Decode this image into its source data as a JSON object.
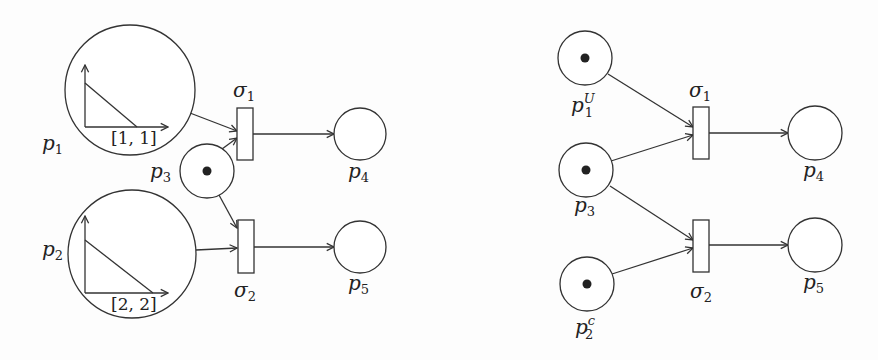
{
  "colors": {
    "stroke": "#333333",
    "token": "#222222",
    "background": "#fdfdfd"
  },
  "left_net": {
    "places": [
      {
        "id": "p1",
        "label": "p",
        "sub": "1",
        "sup": "",
        "cx": 130,
        "cy": 90,
        "r": 65,
        "token": false,
        "lx": 42,
        "ly": 150,
        "inner_plot": {
          "origin": [
            85,
            127
          ],
          "y_top": 65,
          "x_end": 168,
          "line": [
            [
              85,
              83
            ],
            [
              137,
              127
            ]
          ],
          "interval": "[1, 1]",
          "ix": 111,
          "iy": 144
        }
      },
      {
        "id": "p2",
        "label": "p",
        "sub": "2",
        "sup": "",
        "cx": 132,
        "cy": 254,
        "r": 64,
        "token": false,
        "lx": 42,
        "ly": 256,
        "inner_plot": {
          "origin": [
            85,
            293
          ],
          "y_top": 216,
          "x_end": 168,
          "line": [
            [
              85,
              240
            ],
            [
              153,
              293
            ]
          ],
          "interval": "[2, 2]",
          "ix": 111,
          "iy": 310
        }
      },
      {
        "id": "p3",
        "label": "p",
        "sub": "3",
        "sup": "",
        "cx": 207,
        "cy": 171,
        "r": 27,
        "token": true,
        "lx": 150,
        "ly": 178
      },
      {
        "id": "p4",
        "label": "p",
        "sub": "4",
        "sup": "",
        "cx": 360,
        "cy": 134,
        "r": 26,
        "token": false,
        "lx": 348,
        "ly": 178
      },
      {
        "id": "p5",
        "label": "p",
        "sub": "5",
        "sup": "",
        "cx": 360,
        "cy": 247,
        "r": 26,
        "token": false,
        "lx": 348,
        "ly": 290
      }
    ],
    "transitions": [
      {
        "id": "sigma1",
        "label": "σ",
        "sub": "1",
        "x": 237,
        "y": 108,
        "w": 16,
        "h": 52,
        "lx": 233,
        "ly": 97
      },
      {
        "id": "sigma2",
        "label": "σ",
        "sub": "2",
        "x": 238,
        "y": 220,
        "w": 16,
        "h": 53,
        "lx": 234,
        "ly": 297
      }
    ],
    "arcs": [
      {
        "from": "p1",
        "to": "sigma1",
        "points": [
          [
            190,
            113
          ],
          [
            237,
            131
          ]
        ]
      },
      {
        "from": "p3",
        "to": "sigma1",
        "points": [
          [
            222,
            149
          ],
          [
            237,
            138
          ]
        ]
      },
      {
        "from": "sigma1",
        "to": "p4",
        "points": [
          [
            253,
            134
          ],
          [
            334,
            134
          ]
        ]
      },
      {
        "from": "p3",
        "to": "sigma2",
        "points": [
          [
            219,
            195
          ],
          [
            237,
            228
          ]
        ]
      },
      {
        "from": "p2",
        "to": "sigma2",
        "points": [
          [
            196,
            250
          ],
          [
            237,
            248
          ]
        ]
      },
      {
        "from": "sigma2",
        "to": "p5",
        "points": [
          [
            254,
            247
          ],
          [
            334,
            247
          ]
        ]
      }
    ]
  },
  "right_net": {
    "places": [
      {
        "id": "p1U",
        "label": "p",
        "sub": "1",
        "sup": "U",
        "cx": 585,
        "cy": 58,
        "r": 27,
        "token": true,
        "lx": 571,
        "ly": 112
      },
      {
        "id": "p3",
        "label": "p",
        "sub": "3",
        "sup": "",
        "cx": 586,
        "cy": 170,
        "r": 27,
        "token": true,
        "lx": 574,
        "ly": 212
      },
      {
        "id": "p2c",
        "label": "p",
        "sub": "2",
        "sup": "c",
        "cx": 587,
        "cy": 284,
        "r": 27,
        "token": true,
        "lx": 575,
        "ly": 334
      },
      {
        "id": "p4",
        "label": "p",
        "sub": "4",
        "sup": "",
        "cx": 815,
        "cy": 133,
        "r": 27,
        "token": false,
        "lx": 803,
        "ly": 177
      },
      {
        "id": "p5",
        "label": "p",
        "sub": "5",
        "sup": "",
        "cx": 815,
        "cy": 245,
        "r": 27,
        "token": false,
        "lx": 803,
        "ly": 289
      }
    ],
    "transitions": [
      {
        "id": "sigma1",
        "label": "σ",
        "sub": "1",
        "x": 693,
        "y": 107,
        "w": 16,
        "h": 52,
        "lx": 689,
        "ly": 97
      },
      {
        "id": "sigma2",
        "label": "σ",
        "sub": "2",
        "x": 693,
        "y": 220,
        "w": 16,
        "h": 52,
        "lx": 690,
        "ly": 298
      }
    ],
    "arcs": [
      {
        "from": "p1U",
        "to": "sigma1",
        "points": [
          [
            608,
            74
          ],
          [
            693,
            127
          ]
        ]
      },
      {
        "from": "p3",
        "to": "sigma1",
        "points": [
          [
            611,
            161
          ],
          [
            693,
            135
          ]
        ]
      },
      {
        "from": "sigma1",
        "to": "p4",
        "points": [
          [
            709,
            133
          ],
          [
            788,
            133
          ]
        ]
      },
      {
        "from": "p3",
        "to": "sigma2",
        "points": [
          [
            610,
            186
          ],
          [
            693,
            240
          ]
        ]
      },
      {
        "from": "p2c",
        "to": "sigma2",
        "points": [
          [
            612,
            274
          ],
          [
            693,
            248
          ]
        ]
      },
      {
        "from": "sigma2",
        "to": "p5",
        "points": [
          [
            709,
            245
          ],
          [
            788,
            245
          ]
        ]
      }
    ]
  }
}
